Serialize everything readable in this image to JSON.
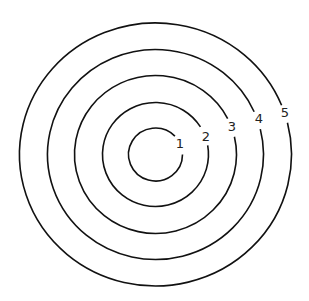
{
  "diagram": {
    "type": "concentric-rings",
    "center": {
      "x": 155.5,
      "y": 154.5
    },
    "stroke_color": "#111111",
    "background": "#ffffff",
    "rings": [
      {
        "label": "1",
        "rx": 27,
        "ry": 26.5,
        "gap_angle_deg": -22,
        "gap_half_deg": 22,
        "label_pos": {
          "x": 180,
          "y": 148
        }
      },
      {
        "label": "2",
        "rx": 53,
        "ry": 52,
        "gap_angle_deg": -21,
        "gap_half_deg": 11,
        "label_pos": {
          "x": 206,
          "y": 141
        }
      },
      {
        "label": "3",
        "rx": 81,
        "ry": 79,
        "gap_angle_deg": -20,
        "gap_half_deg": 7,
        "label_pos": {
          "x": 232,
          "y": 131
        }
      },
      {
        "label": "4",
        "rx": 108,
        "ry": 105,
        "gap_angle_deg": -19,
        "gap_half_deg": 5,
        "label_pos": {
          "x": 259,
          "y": 123
        }
      },
      {
        "label": "5",
        "rx": 136,
        "ry": 131.5,
        "gap_angle_deg": -18,
        "gap_half_deg": 4,
        "label_pos": {
          "x": 285,
          "y": 117
        }
      }
    ]
  }
}
